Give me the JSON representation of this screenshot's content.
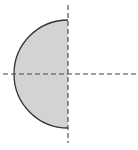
{
  "diagram": {
    "center": {
      "x": 68,
      "y": 74
    },
    "radius": 54,
    "shape": {
      "type": "semicircle",
      "side": "left",
      "fill": "#d3d3d3",
      "stroke": "#333333"
    },
    "axes": {
      "vertical": {
        "x": 68,
        "y1": 5,
        "y2": 143,
        "style": "dashed",
        "color": "#444444"
      },
      "horizontal": {
        "y": 74,
        "x1": 3,
        "x2": 136,
        "style": "dashed",
        "color": "#444444"
      }
    }
  }
}
